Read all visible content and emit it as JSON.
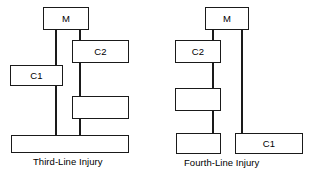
{
  "figure": {
    "title": "",
    "background_color": "#ffffff",
    "stroke_color": "#1a1a1a",
    "fill_color": "#ffffff"
  },
  "diagrams": [
    {
      "id": "third-line-injury",
      "caption": "Third-Line Injury",
      "nodes": [
        {
          "id": "third-m",
          "label": "M",
          "labeled": true
        },
        {
          "id": "third-c2",
          "label": "C2",
          "labeled": true
        },
        {
          "id": "third-c1",
          "label": "C1",
          "labeled": true
        },
        {
          "id": "third-blank",
          "label": "",
          "labeled": false
        },
        {
          "id": "third-base",
          "label": "",
          "labeled": false
        }
      ],
      "connectors": [
        {
          "id": "third-line-left",
          "from": "third-m",
          "through": [
            "third-c1"
          ],
          "to": "third-base"
        },
        {
          "id": "third-line-right",
          "from": "third-m",
          "through": [
            "third-c2",
            "third-blank"
          ],
          "to": "third-base"
        }
      ]
    },
    {
      "id": "fourth-line-injury",
      "caption": "Fourth-Line Injury",
      "nodes": [
        {
          "id": "fourth-m",
          "label": "M",
          "labeled": true
        },
        {
          "id": "fourth-c2",
          "label": "C2",
          "labeled": true
        },
        {
          "id": "fourth-blank-1",
          "label": "",
          "labeled": false
        },
        {
          "id": "fourth-blank-2",
          "label": "",
          "labeled": false
        },
        {
          "id": "fourth-c1",
          "label": "C1",
          "labeled": true
        }
      ],
      "connectors": [
        {
          "id": "fourth-line-left",
          "from": "fourth-m",
          "through": [
            "fourth-c2",
            "fourth-blank-1"
          ],
          "to": "fourth-blank-2"
        },
        {
          "id": "fourth-line-right",
          "from": "fourth-m",
          "through": [],
          "to": "fourth-c1"
        }
      ]
    }
  ]
}
